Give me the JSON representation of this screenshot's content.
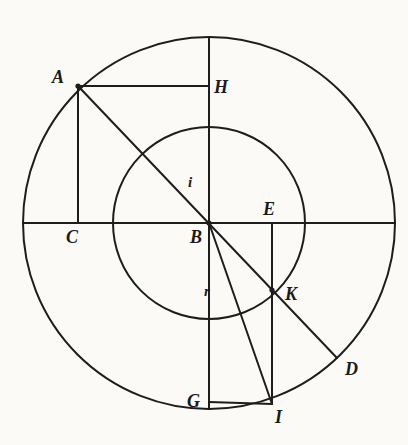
{
  "figure": {
    "background_color": "#fbfaf7",
    "stroke_color": "#1d1d1d",
    "canvas": {
      "width": 408,
      "height": 445
    },
    "center": {
      "x": 209,
      "y": 223
    },
    "circles": [
      {
        "name": "outer-circle",
        "cx": 209,
        "cy": 223,
        "r": 186
      },
      {
        "name": "inner-circle",
        "cx": 209,
        "cy": 223,
        "r": 96
      }
    ],
    "points": [
      {
        "id": "A",
        "label": "A",
        "x": 78,
        "y": 86,
        "label_x": 52,
        "label_y": 68
      },
      {
        "id": "H",
        "label": "H",
        "x": 209,
        "y": 86,
        "label_x": 214,
        "label_y": 78
      },
      {
        "id": "C",
        "label": "C",
        "x": 78,
        "y": 223,
        "label_x": 66,
        "label_y": 228
      },
      {
        "id": "B",
        "label": "B",
        "x": 209,
        "y": 223,
        "label_x": 190,
        "label_y": 228
      },
      {
        "id": "E",
        "label": "E",
        "x": 272,
        "y": 223,
        "label_x": 263,
        "label_y": 200
      },
      {
        "id": "K",
        "label": "K",
        "x": 272,
        "y": 290,
        "label_x": 285,
        "label_y": 285
      },
      {
        "id": "D",
        "label": "D",
        "x": 337,
        "y": 358,
        "label_x": 345,
        "label_y": 360
      },
      {
        "id": "G",
        "label": "G",
        "x": 209,
        "y": 402,
        "label_x": 187,
        "label_y": 392
      },
      {
        "id": "I",
        "label": "I",
        "x": 272,
        "y": 404,
        "label_x": 275,
        "label_y": 408
      }
    ],
    "segment_labels": [
      {
        "id": "i",
        "label": "i",
        "x": 188,
        "y": 175,
        "meaning": "angle-of-incidence-label"
      },
      {
        "id": "r",
        "label": "r",
        "x": 204,
        "y": 284,
        "meaning": "angle-of-refraction-label"
      }
    ],
    "lines": [
      {
        "name": "horizontal-diameter",
        "x1": 23,
        "y1": 223,
        "x2": 395,
        "y2": 223
      },
      {
        "name": "vertical-diameter",
        "x1": 209,
        "y1": 37,
        "x2": 209,
        "y2": 409
      },
      {
        "name": "line-A-to-D",
        "x1": 78,
        "y1": 86,
        "x2": 337,
        "y2": 358
      },
      {
        "name": "line-A-to-H",
        "x1": 78,
        "y1": 86,
        "x2": 209,
        "y2": 86
      },
      {
        "name": "line-A-to-C",
        "x1": 78,
        "y1": 86,
        "x2": 78,
        "y2": 223
      },
      {
        "name": "line-E-to-I",
        "x1": 272,
        "y1": 223,
        "x2": 272,
        "y2": 404
      },
      {
        "name": "line-B-to-I",
        "x1": 209,
        "y1": 223,
        "x2": 272,
        "y2": 404
      },
      {
        "name": "line-G-to-I",
        "x1": 209,
        "y1": 402,
        "x2": 272,
        "y2": 404
      }
    ]
  }
}
